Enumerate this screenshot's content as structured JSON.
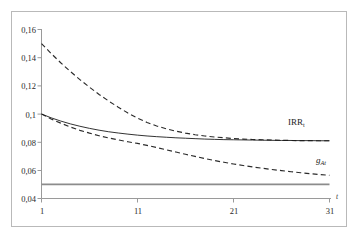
{
  "figure": {
    "background_color": "#ffffff",
    "frame_color": "#b9b9b9"
  },
  "axes": {
    "x_axis_name": "t",
    "y_tick_labels": [
      "0,16",
      "0,14",
      "0,12",
      "0,1",
      "0,08",
      "0,06",
      "0,04"
    ],
    "x_tick_labels": [
      "1",
      "11",
      "21",
      "31"
    ]
  },
  "labels": {
    "irr": {
      "text": "IRR",
      "subscript": "t"
    },
    "g": {
      "text": "g",
      "subscript": "At"
    }
  },
  "chart_data": {
    "type": "line",
    "title": "",
    "subtitle": "",
    "xlabel": "t",
    "ylabel": "",
    "xlim": [
      1,
      31
    ],
    "ylim": [
      0.04,
      0.16
    ],
    "xticks": [
      1,
      11,
      21,
      31
    ],
    "yticks": [
      0.04,
      0.06,
      0.08,
      0.1,
      0.12,
      0.14,
      0.16
    ],
    "ytick_labels": [
      "0,04",
      "0,06",
      "0,08",
      "0,1",
      "0,12",
      "0,14",
      "0,16"
    ],
    "xtick_labels": [
      "1",
      "11",
      "21",
      "31"
    ],
    "grid": false,
    "legend": "none",
    "annotations": [
      {
        "text": "IRR_t",
        "x": 27.5,
        "y": 0.0895
      },
      {
        "text": "g_At",
        "x": 30.5,
        "y": 0.0625
      }
    ],
    "series": [
      {
        "name": "upper_dashed_decay",
        "style": "dashed",
        "color": "#2b2b2b",
        "x": [
          1,
          2,
          3,
          4,
          5,
          6,
          7,
          8,
          9,
          10,
          11,
          12,
          13,
          14,
          15,
          16,
          17,
          18,
          19,
          20,
          21,
          22,
          23,
          24,
          25,
          26,
          27,
          28,
          29,
          30,
          31
        ],
        "values": [
          0.15,
          0.143,
          0.1364,
          0.1302,
          0.1244,
          0.119,
          0.1139,
          0.1092,
          0.1048,
          0.1007,
          0.097,
          0.094,
          0.0915,
          0.0895,
          0.0878,
          0.0864,
          0.0853,
          0.0844,
          0.0837,
          0.0831,
          0.0826,
          0.0822,
          0.0819,
          0.0817,
          0.0815,
          0.0813,
          0.0812,
          0.0811,
          0.0811,
          0.081,
          0.081
        ]
      },
      {
        "name": "irr_solid",
        "style": "solid",
        "color": "#1c1c1c",
        "x": [
          1,
          2,
          3,
          4,
          5,
          6,
          7,
          8,
          9,
          10,
          11,
          12,
          13,
          14,
          15,
          16,
          17,
          18,
          19,
          20,
          21,
          22,
          23,
          24,
          25,
          26,
          27,
          28,
          29,
          30,
          31
        ],
        "values": [
          0.1,
          0.0973,
          0.095,
          0.093,
          0.0913,
          0.0898,
          0.0885,
          0.0874,
          0.0865,
          0.0857,
          0.085,
          0.0844,
          0.0839,
          0.0835,
          0.0831,
          0.0828,
          0.0825,
          0.0822,
          0.082,
          0.0818,
          0.0817,
          0.0816,
          0.0815,
          0.0814,
          0.0813,
          0.0812,
          0.0812,
          0.0811,
          0.0811,
          0.081,
          0.081
        ]
      },
      {
        "name": "g_dashed_decay",
        "style": "dashed",
        "color": "#2b2b2b",
        "x": [
          1,
          2,
          3,
          4,
          5,
          6,
          7,
          8,
          9,
          10,
          11,
          12,
          13,
          14,
          15,
          16,
          17,
          18,
          19,
          20,
          21,
          22,
          23,
          24,
          25,
          26,
          27,
          28,
          29,
          30,
          31
        ],
        "values": [
          0.1,
          0.0965,
          0.0935,
          0.0908,
          0.0884,
          0.0864,
          0.0846,
          0.083,
          0.0816,
          0.0803,
          0.0791,
          0.0777,
          0.0762,
          0.0746,
          0.073,
          0.0714,
          0.0699,
          0.0684,
          0.067,
          0.0657,
          0.0645,
          0.0634,
          0.0624,
          0.0615,
          0.0606,
          0.0598,
          0.059,
          0.0583,
          0.0576,
          0.057,
          0.0565
        ]
      },
      {
        "name": "baseline_constant",
        "style": "solid",
        "color": "#8c8c8c",
        "x": [
          1,
          31
        ],
        "values": [
          0.05,
          0.05
        ]
      }
    ]
  }
}
